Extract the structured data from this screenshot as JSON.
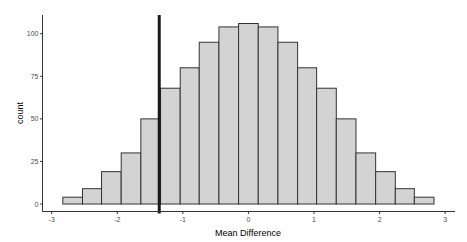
{
  "chart_data": {
    "type": "bar",
    "subtype": "histogram",
    "title": "",
    "xlabel": "Mean Difference",
    "ylabel": "count",
    "xlim": [
      -3.14,
      3.15
    ],
    "ylim": [
      -4.4,
      111
    ],
    "x_ticks": [
      -3,
      -2,
      -1,
      0,
      1,
      2,
      3
    ],
    "x_tick_labels": [
      "-3",
      "-2",
      "-1",
      "0",
      "1",
      "2",
      "3"
    ],
    "y_ticks": [
      0,
      25,
      50,
      75,
      100
    ],
    "y_tick_labels": [
      "0",
      "25",
      "50",
      "75",
      "100"
    ],
    "grid": false,
    "legend": null,
    "bin_start": -2.83,
    "bin_width": 0.298,
    "bins": [
      {
        "x0": -2.83,
        "x1": -2.53,
        "count": 4
      },
      {
        "x0": -2.53,
        "x1": -2.24,
        "count": 9
      },
      {
        "x0": -2.24,
        "x1": -1.94,
        "count": 19
      },
      {
        "x0": -1.94,
        "x1": -1.64,
        "count": 30
      },
      {
        "x0": -1.64,
        "x1": -1.34,
        "count": 50
      },
      {
        "x0": -1.34,
        "x1": -1.04,
        "count": 68
      },
      {
        "x0": -1.04,
        "x1": -0.75,
        "count": 80
      },
      {
        "x0": -0.75,
        "x1": -0.45,
        "count": 95
      },
      {
        "x0": -0.45,
        "x1": -0.15,
        "count": 104
      },
      {
        "x0": -0.15,
        "x1": 0.15,
        "count": 106
      },
      {
        "x0": 0.15,
        "x1": 0.45,
        "count": 104
      },
      {
        "x0": 0.45,
        "x1": 0.75,
        "count": 95
      },
      {
        "x0": 0.75,
        "x1": 1.04,
        "count": 80
      },
      {
        "x0": 1.04,
        "x1": 1.34,
        "count": 68
      },
      {
        "x0": 1.34,
        "x1": 1.64,
        "count": 50
      },
      {
        "x0": 1.64,
        "x1": 1.94,
        "count": 30
      },
      {
        "x0": 1.94,
        "x1": 2.24,
        "count": 19
      },
      {
        "x0": 2.24,
        "x1": 2.53,
        "count": 9
      },
      {
        "x0": 2.53,
        "x1": 2.83,
        "count": 4
      }
    ],
    "categories": [
      "-2.68",
      "-2.38",
      "-2.09",
      "-1.79",
      "-1.49",
      "-1.19",
      "-0.89",
      "-0.60",
      "-0.30",
      "0.00",
      "0.30",
      "0.60",
      "0.89",
      "1.19",
      "1.49",
      "1.79",
      "2.09",
      "2.38",
      "2.68"
    ],
    "values": [
      4,
      9,
      19,
      30,
      50,
      68,
      80,
      95,
      104,
      106,
      104,
      95,
      80,
      68,
      50,
      30,
      19,
      9,
      4
    ],
    "annotations": [
      {
        "type": "vline",
        "x": -1.36,
        "color": "#1a1a1a",
        "linewidth": "thick"
      }
    ],
    "colors": {
      "bar_fill": "#d3d3d3",
      "bar_outline": "#333333",
      "vline": "#1a1a1a",
      "axis": "#333333",
      "tick_text": "#4d4d4d",
      "background": "#ffffff"
    }
  }
}
